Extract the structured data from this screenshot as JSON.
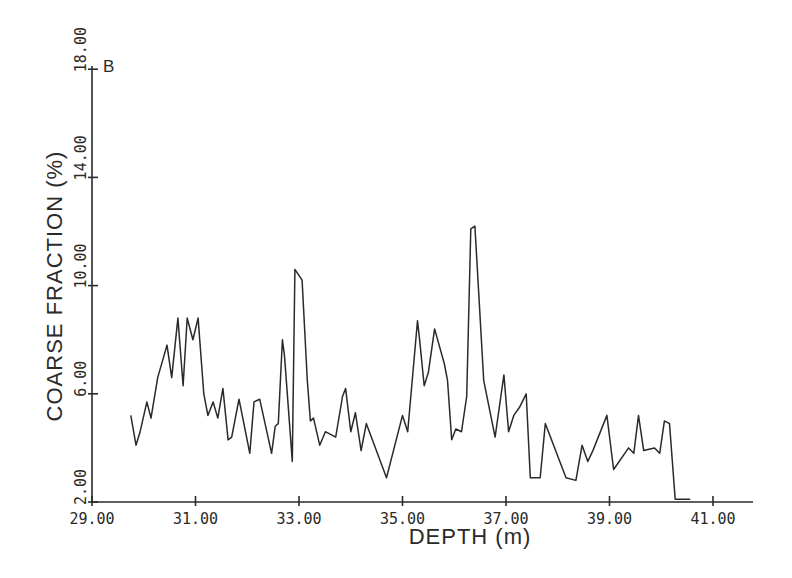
{
  "chart_data": {
    "type": "line",
    "panel_label": "B",
    "title": "",
    "xlabel": "DEPTH (m)",
    "ylabel": "COARSE FRACTION (%)",
    "xlim": [
      29.0,
      41.7
    ],
    "ylim": [
      2.0,
      18.0
    ],
    "x_ticks": [
      29.0,
      31.0,
      33.0,
      35.0,
      37.0,
      39.0,
      41.0
    ],
    "x_tick_labels": [
      "29.00",
      "31.00",
      "33.00",
      "35.00",
      "37.00",
      "39.00",
      "41.00"
    ],
    "y_ticks": [
      2.0,
      6.0,
      10.0,
      14.0,
      18.0
    ],
    "y_tick_labels": [
      "2.00",
      "6.00",
      "10.00",
      "14.00",
      "18.00"
    ],
    "grid": false,
    "legend": null,
    "series": [
      {
        "name": "Coarse fraction",
        "x": [
          29.75,
          29.85,
          29.93,
          30.06,
          30.14,
          30.27,
          30.45,
          30.54,
          30.66,
          30.76,
          30.84,
          30.95,
          31.05,
          31.16,
          31.24,
          31.34,
          31.43,
          31.53,
          31.63,
          31.7,
          31.84,
          32.05,
          32.13,
          32.24,
          32.47,
          32.54,
          32.6,
          32.68,
          32.72,
          32.87,
          32.92,
          33.06,
          33.16,
          33.22,
          33.28,
          33.4,
          33.51,
          33.71,
          33.84,
          33.9,
          34.0,
          34.09,
          34.2,
          34.3,
          34.69,
          35.0,
          35.1,
          35.29,
          35.33,
          35.42,
          35.5,
          35.62,
          35.81,
          35.87,
          35.95,
          36.03,
          36.14,
          36.24,
          36.32,
          36.4,
          36.57,
          36.79,
          36.96,
          37.05,
          37.15,
          37.26,
          37.39,
          37.47,
          37.66,
          37.76,
          38.16,
          38.35,
          38.47,
          38.58,
          38.68,
          38.95,
          39.08,
          39.37,
          39.47,
          39.56,
          39.66,
          39.87,
          39.97,
          40.06,
          40.16,
          40.27,
          40.56
        ],
        "y": [
          5.2,
          4.1,
          4.6,
          5.7,
          5.1,
          6.6,
          7.8,
          6.6,
          8.8,
          6.3,
          8.8,
          8.0,
          8.8,
          6.0,
          5.2,
          5.7,
          5.1,
          6.2,
          4.3,
          4.4,
          5.8,
          3.8,
          5.7,
          5.8,
          3.8,
          4.8,
          4.9,
          8.0,
          7.4,
          3.5,
          10.6,
          10.2,
          6.5,
          5.0,
          5.1,
          4.1,
          4.6,
          4.4,
          5.9,
          6.2,
          4.6,
          5.3,
          3.9,
          4.9,
          2.9,
          5.2,
          4.6,
          8.7,
          8.0,
          6.3,
          6.8,
          8.4,
          7.1,
          6.5,
          4.3,
          4.7,
          4.6,
          5.9,
          12.1,
          12.2,
          6.5,
          4.4,
          6.7,
          4.6,
          5.2,
          5.5,
          6.0,
          2.9,
          2.9,
          4.9,
          2.9,
          2.8,
          4.1,
          3.5,
          3.9,
          5.2,
          3.2,
          4.0,
          3.8,
          5.2,
          3.9,
          4.0,
          3.8,
          5.0,
          4.9,
          2.1,
          2.1
        ]
      }
    ]
  }
}
